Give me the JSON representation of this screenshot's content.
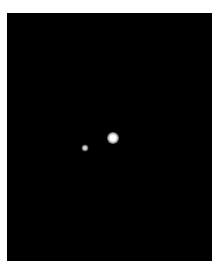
{
  "image": {
    "background_color": "#000000",
    "frame_color": "#ffffff",
    "subjects": [
      {
        "name": "bright-point-source",
        "x": 113,
        "y": 138,
        "brightness": "high"
      },
      {
        "name": "faint-point-source",
        "x": 85,
        "y": 148,
        "brightness": "low"
      }
    ]
  }
}
